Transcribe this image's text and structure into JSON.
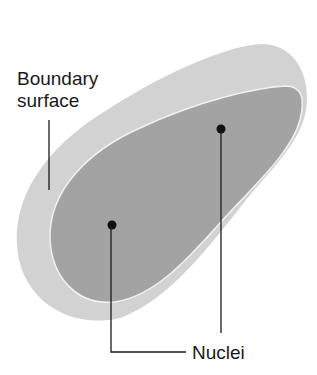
{
  "diagram": {
    "labels": {
      "boundary_line1": "Boundary",
      "boundary_line2": "surface",
      "nuclei": "Nuclei"
    },
    "colors": {
      "outer_surface": "#d2d2d2",
      "inner_region": "#a3a3a3",
      "rim_highlight": "#f2f2f2",
      "leader_line": "#1a1a1a",
      "background": "#ffffff"
    },
    "nuclei_points": [
      {
        "name": "nucleus-left",
        "x": 112,
        "y": 225
      },
      {
        "name": "nucleus-right",
        "x": 221,
        "y": 129
      }
    ]
  }
}
